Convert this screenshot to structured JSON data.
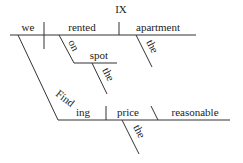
{
  "title": "IX",
  "diagram": {
    "type": "sentence-diagram",
    "main_clause": {
      "subject": "we",
      "verb": "rented",
      "object": "apartment",
      "object_modifier": "the",
      "prepositional_phrase": {
        "preposition": "on",
        "object": "spot",
        "object_modifier": "the"
      }
    },
    "subject_clause": {
      "gerund_stem": "Find",
      "gerund_suffix": "ing",
      "gerund_slant": "Finding",
      "object": "price",
      "object_modifier": "the",
      "complement": "reasonable"
    }
  }
}
